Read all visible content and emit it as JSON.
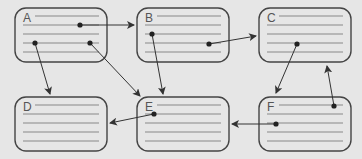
{
  "diagram": {
    "background": "#e6e6e6",
    "stroke_color": "#444444",
    "line_color": "#888888",
    "nodes": [
      {
        "id": "A",
        "label": "A",
        "x": 15,
        "y": 8,
        "w": 92,
        "h": 54
      },
      {
        "id": "B",
        "label": "B",
        "x": 137,
        "y": 8,
        "w": 92,
        "h": 54
      },
      {
        "id": "C",
        "label": "C",
        "x": 259,
        "y": 8,
        "w": 92,
        "h": 54
      },
      {
        "id": "D",
        "label": "D",
        "x": 15,
        "y": 97,
        "w": 92,
        "h": 54
      },
      {
        "id": "E",
        "label": "E",
        "x": 137,
        "y": 97,
        "w": 92,
        "h": 54
      },
      {
        "id": "F",
        "label": "F",
        "x": 259,
        "y": 97,
        "w": 92,
        "h": 54
      }
    ],
    "edges": [
      {
        "from": "A",
        "to": "B",
        "x1": 80,
        "y1": 25,
        "x2": 134,
        "y2": 25
      },
      {
        "from": "A",
        "to": "D",
        "x1": 35,
        "y1": 43,
        "x2": 50,
        "y2": 94
      },
      {
        "from": "A",
        "to": "E",
        "x1": 90,
        "y1": 43,
        "x2": 140,
        "y2": 96
      },
      {
        "from": "B",
        "to": "E",
        "x1": 152,
        "y1": 34,
        "x2": 163,
        "y2": 94
      },
      {
        "from": "B",
        "to": "C",
        "x1": 209,
        "y1": 44,
        "x2": 256,
        "y2": 36
      },
      {
        "from": "C",
        "to": "F",
        "x1": 297,
        "y1": 44,
        "x2": 276,
        "y2": 93
      },
      {
        "from": "F",
        "to": "C",
        "x1": 334,
        "y1": 106,
        "x2": 327,
        "y2": 66
      },
      {
        "from": "F",
        "to": "E",
        "x1": 276,
        "y1": 124,
        "x2": 232,
        "y2": 124
      },
      {
        "from": "E",
        "to": "D",
        "x1": 154,
        "y1": 114,
        "x2": 110,
        "y2": 123
      }
    ]
  }
}
